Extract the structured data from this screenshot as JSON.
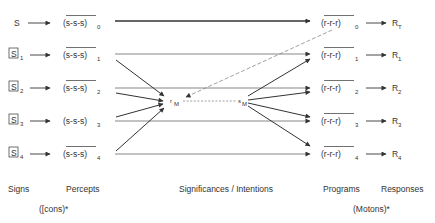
{
  "rows": [
    {
      "sign": "S",
      "sign_boxed": false,
      "sign_sub": "",
      "percept": "(s-s-s)",
      "percept_sub": "0",
      "program": "(r-r-r)",
      "program_sub": "0",
      "response": "R",
      "response_sub": "T"
    },
    {
      "sign": "S",
      "sign_boxed": true,
      "sign_sub": "1",
      "percept": "(s-s-s)",
      "percept_sub": "1",
      "program": "(r-r-r)",
      "program_sub": "1",
      "response": "R",
      "response_sub": "1"
    },
    {
      "sign": "S",
      "sign_boxed": true,
      "sign_sub": "2",
      "percept": "(s-s-s)",
      "percept_sub": "2",
      "program": "(r-r-r)",
      "program_sub": "2",
      "response": "R",
      "response_sub": "2"
    },
    {
      "sign": "S",
      "sign_boxed": true,
      "sign_sub": "3",
      "percept": "(s-s-s)",
      "percept_sub": "3",
      "program": "(r-r-r)",
      "program_sub": "3",
      "response": "R",
      "response_sub": "3"
    },
    {
      "sign": "S",
      "sign_boxed": true,
      "sign_sub": "4",
      "percept": "(s-s-s)",
      "percept_sub": "4",
      "program": "(r-r-r)",
      "program_sub": "4",
      "response": "R",
      "response_sub": "4"
    }
  ],
  "mediators": {
    "r": {
      "main": "r",
      "sub": "M"
    },
    "s": {
      "main": "s",
      "sub": "M"
    }
  },
  "column_labels": {
    "signs": "Signs",
    "percepts": "Percepts",
    "significances": "Significances / Intentions",
    "programs": "Programs",
    "responses": "Responses"
  },
  "footnotes": {
    "icons": "([cons)*",
    "motons": "(Motons)*"
  },
  "colors": {
    "ink": "#333333",
    "dashed": "#888888",
    "background": "#ffffff"
  }
}
